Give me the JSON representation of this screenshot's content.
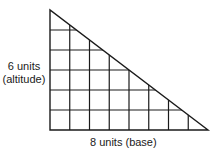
{
  "diagram": {
    "altitude_label_line1": "6 units",
    "altitude_label_line2": "(altitude)",
    "base_label": "8 units (base)",
    "altitude_units": 6,
    "base_units": 8,
    "colors": {
      "line": "#1a1a1a",
      "background": "#ffffff"
    }
  }
}
